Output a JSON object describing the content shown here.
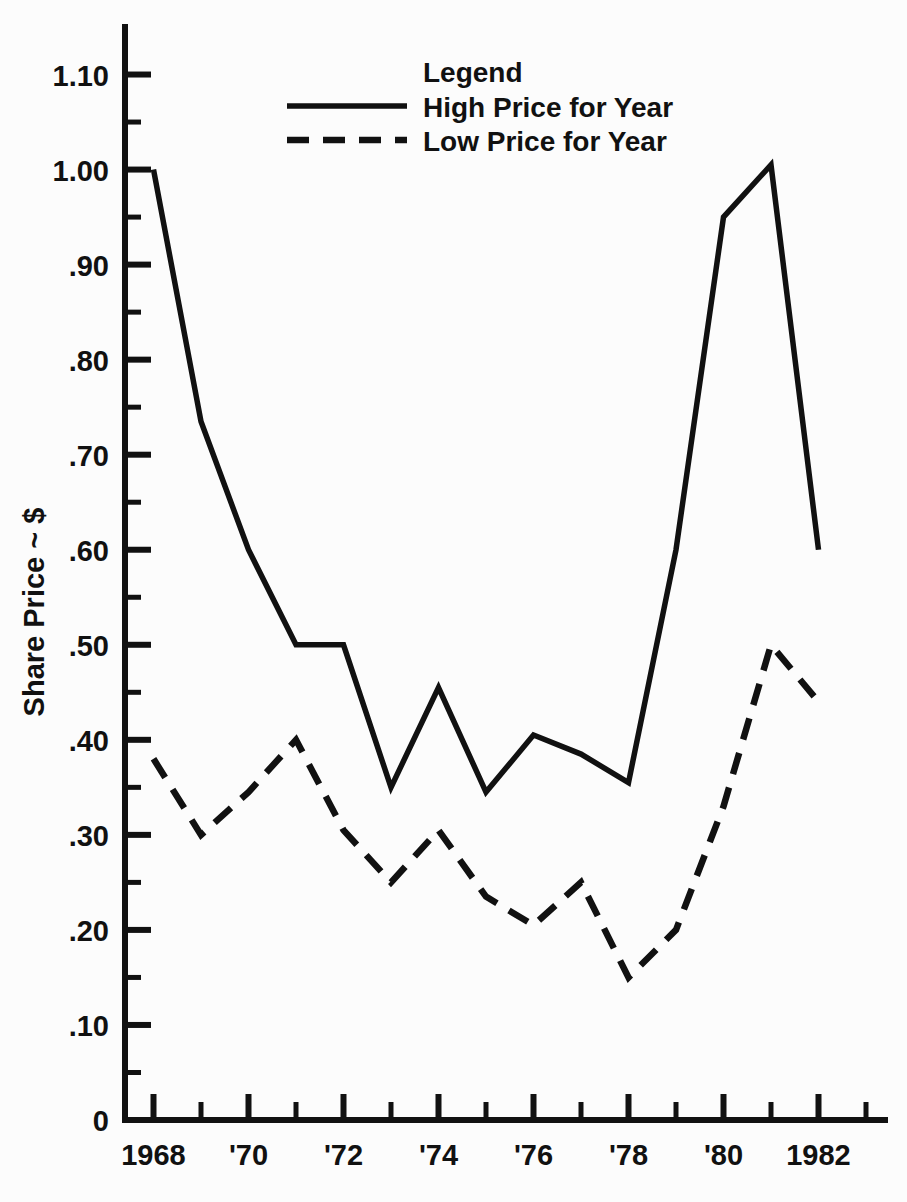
{
  "chart_data": {
    "type": "line",
    "title": "",
    "xlabel": "",
    "ylabel": "Share Price ~ $",
    "ylim": [
      0,
      1.15
    ],
    "xlim": [
      1967.4,
      1983.4
    ],
    "grid": false,
    "legend_position": "top-center",
    "legend_title": "Legend",
    "x": [
      1968,
      1969,
      1970,
      1971,
      1972,
      1973,
      1974,
      1975,
      1976,
      1977,
      1978,
      1979,
      1980,
      1981,
      1982
    ],
    "series": [
      {
        "name": "High Price for Year",
        "style": "solid",
        "values": [
          1.0,
          0.735,
          0.6,
          0.5,
          0.5,
          0.35,
          0.455,
          0.345,
          0.405,
          0.385,
          0.355,
          0.6,
          0.95,
          1.005,
          0.6
        ]
      },
      {
        "name": "Low Price for Year",
        "style": "dashed",
        "values": [
          0.38,
          0.3,
          0.345,
          0.4,
          0.305,
          0.25,
          0.305,
          0.235,
          0.205,
          0.25,
          0.15,
          0.2,
          0.33,
          0.5,
          0.44
        ]
      }
    ],
    "y_ticks_major": [
      0,
      0.1,
      0.2,
      0.3,
      0.4,
      0.5,
      0.6,
      0.7,
      0.8,
      0.9,
      1.0,
      1.1
    ],
    "y_tick_labels": [
      "0",
      ".10",
      ".20",
      ".30",
      ".40",
      ".50",
      ".60",
      ".70",
      ".80",
      ".90",
      "1.00",
      "1.10"
    ],
    "y_ticks_minor": [
      0.05,
      0.15,
      0.25,
      0.35,
      0.45,
      0.55,
      0.65,
      0.75,
      0.85,
      0.95,
      1.05
    ],
    "x_ticks": [
      1968,
      1969,
      1970,
      1971,
      1972,
      1973,
      1974,
      1975,
      1976,
      1977,
      1978,
      1979,
      1980,
      1981,
      1982,
      1983
    ],
    "x_tick_labels": [
      {
        "x": 1968,
        "label": "1968"
      },
      {
        "x": 1970,
        "label": "'70"
      },
      {
        "x": 1972,
        "label": "'72"
      },
      {
        "x": 1974,
        "label": "'74"
      },
      {
        "x": 1976,
        "label": "'76"
      },
      {
        "x": 1978,
        "label": "'78"
      },
      {
        "x": 1980,
        "label": "'80"
      },
      {
        "x": 1982,
        "label": "1982"
      }
    ],
    "colors": {
      "ink": "#111111",
      "background": "#fcfcfc"
    }
  }
}
